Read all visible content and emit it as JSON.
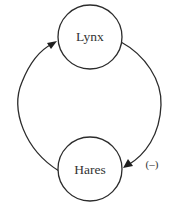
{
  "diagram": {
    "type": "feedback-loop",
    "nodes": [
      {
        "id": "lynx",
        "label": "Lynx"
      },
      {
        "id": "hares",
        "label": "Hares"
      }
    ],
    "edges": [
      {
        "from": "hares",
        "to": "lynx",
        "label": ""
      },
      {
        "from": "lynx",
        "to": "hares",
        "label": "(–)"
      }
    ],
    "colors": {
      "stroke": "#2b2b2b",
      "text": "#333333",
      "background": "#ffffff"
    }
  }
}
